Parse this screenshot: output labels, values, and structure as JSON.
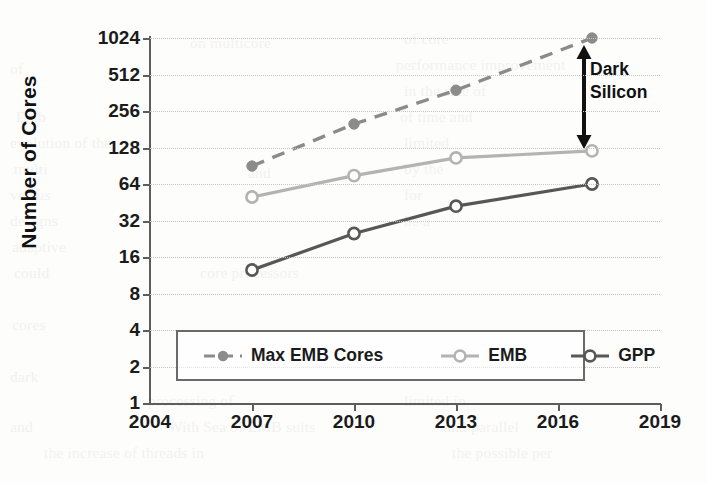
{
  "chart_data": {
    "type": "line",
    "title": "",
    "xlabel": "",
    "ylabel": "Number of Cores",
    "xlim": [
      2004,
      2019
    ],
    "ylim": [
      1,
      1024
    ],
    "yscale": "log2",
    "grid": true,
    "legend_position": "bottom-left-inside",
    "x": [
      2007,
      2010,
      2013,
      2017
    ],
    "xtick_labels": [
      "2004",
      "2007",
      "2010",
      "2013",
      "2016",
      "2019"
    ],
    "xticks": [
      2004,
      2007,
      2010,
      2013,
      2016,
      2019
    ],
    "ytick_labels": [
      "1",
      "2",
      "4",
      "8",
      "16",
      "32",
      "64",
      "128",
      "256",
      "512",
      "1024"
    ],
    "yticks": [
      1,
      2,
      4,
      8,
      16,
      32,
      64,
      128,
      256,
      512,
      1024
    ],
    "series": [
      {
        "name": "Max EMB Cores",
        "style": "dashed",
        "marker": "filled-circle",
        "color": "#8b8b8b",
        "values": [
          90,
          200,
          380,
          1024
        ]
      },
      {
        "name": "EMB",
        "style": "solid",
        "marker": "open-circle",
        "color": "#b3b3b3",
        "values": [
          50,
          75,
          105,
          120
        ]
      },
      {
        "name": "GPP",
        "style": "solid",
        "marker": "open-circle",
        "color": "#575757",
        "values": [
          12.5,
          25,
          42,
          64
        ]
      }
    ],
    "annotations": [
      {
        "text": "Dark Silicon",
        "lines": [
          "Dark",
          "Silicon"
        ],
        "type": "double-headed-arrow",
        "at_x": 2017,
        "from_y": 120,
        "to_y": 1024
      }
    ]
  },
  "legend": {
    "entries": [
      {
        "label": "Max EMB Cores"
      },
      {
        "label": "EMB"
      },
      {
        "label": "GPP"
      }
    ]
  },
  "bleed_text": [
    {
      "t": "of core",
      "x": 404,
      "y": 26
    },
    {
      "t": "on multicore",
      "x": 190,
      "y": 30
    },
    {
      "t": "of",
      "x": 10,
      "y": 56
    },
    {
      "t": "performance improvement",
      "x": 396,
      "y": 52
    },
    {
      "t": "Emb",
      "x": 16,
      "y": 104
    },
    {
      "t": "in the size of",
      "x": 404,
      "y": 78
    },
    {
      "t": "evolution of the",
      "x": 10,
      "y": 130
    },
    {
      "t": "of time and",
      "x": 400,
      "y": 104
    },
    {
      "t": "and",
      "x": 248,
      "y": 160
    },
    {
      "t": "multi",
      "x": 14,
      "y": 156
    },
    {
      "t": "limited",
      "x": 404,
      "y": 130
    },
    {
      "t": "versus",
      "x": 10,
      "y": 182
    },
    {
      "t": "core processors",
      "x": 200,
      "y": 260
    },
    {
      "t": "by the",
      "x": 404,
      "y": 156
    },
    {
      "t": "designs",
      "x": 10,
      "y": 208
    },
    {
      "t": "adaptive",
      "x": 12,
      "y": 234
    },
    {
      "t": "for",
      "x": 404,
      "y": 182
    },
    {
      "t": "could",
      "x": 14,
      "y": 260
    },
    {
      "t": "be a",
      "x": 404,
      "y": 208
    },
    {
      "t": "cores",
      "x": 12,
      "y": 312
    },
    {
      "t": "dark",
      "x": 10,
      "y": 364
    },
    {
      "t": "processing of",
      "x": 148,
      "y": 388
    },
    {
      "t": "limited in",
      "x": 404,
      "y": 388
    },
    {
      "t": "and",
      "x": 10,
      "y": 414
    },
    {
      "t": "With Sea of EMB suits",
      "x": 168,
      "y": 414
    },
    {
      "t": "and parallel",
      "x": 444,
      "y": 414
    },
    {
      "t": "the increase of threads in",
      "x": 44,
      "y": 440
    },
    {
      "t": "the possible per",
      "x": 452,
      "y": 440
    }
  ]
}
